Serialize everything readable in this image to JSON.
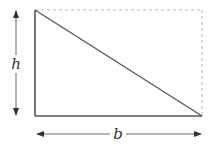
{
  "diagram": {
    "labels": {
      "height": "h",
      "base": "b"
    },
    "colors": {
      "stroke": "#555555",
      "dashed": "#b8b8b8",
      "label": "#333333",
      "background": "#ffffff"
    },
    "geometry": {
      "top_left": [
        35,
        10
      ],
      "bottom_left": [
        35,
        116
      ],
      "bottom_right": [
        202,
        116
      ],
      "top_right": [
        202,
        10
      ]
    }
  }
}
